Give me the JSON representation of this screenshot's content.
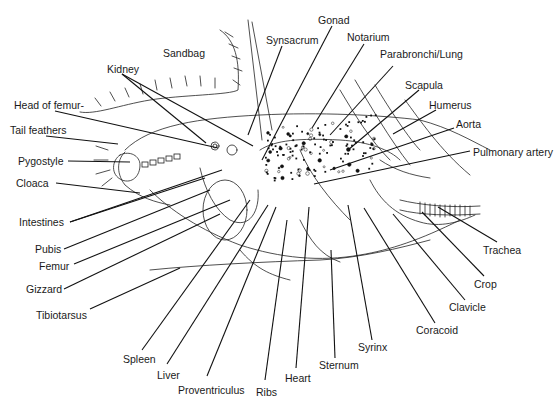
{
  "figure": {
    "type": "anatomical-diagram",
    "labels": [
      {
        "id": "gonad",
        "text": "Gonad",
        "x": 318,
        "y": 14,
        "lx1": 332,
        "ly1": 26,
        "lx2": 262,
        "ly2": 160
      },
      {
        "id": "synsacrum",
        "text": "Synsacrum",
        "x": 266,
        "y": 34,
        "lx1": 282,
        "ly1": 46,
        "lx2": 248,
        "ly2": 135
      },
      {
        "id": "notarium",
        "text": "Notarium",
        "x": 347,
        "y": 31,
        "lx1": 364,
        "ly1": 44,
        "lx2": 312,
        "ly2": 128
      },
      {
        "id": "sandbag",
        "text": "Sandbag",
        "x": 163,
        "y": 47,
        "lx1": null,
        "ly1": null,
        "lx2": null,
        "ly2": null
      },
      {
        "id": "parabronchi-lung",
        "text": "Parabronchi/Lung",
        "x": 380,
        "y": 48,
        "lx1": 393,
        "ly1": 66,
        "lx2": 330,
        "ly2": 135
      },
      {
        "id": "kidney",
        "text": "Kidney",
        "x": 107,
        "y": 63,
        "lx1": 122,
        "ly1": 74,
        "lx2": 206,
        "ly2": 143
      },
      {
        "id": "scapula",
        "text": "Scapula",
        "x": 405,
        "y": 79,
        "lx1": 419,
        "ly1": 90,
        "lx2": 348,
        "ly2": 150
      },
      {
        "id": "head-of-femur",
        "text": "Head of femur-",
        "x": 14,
        "y": 99,
        "lx1": 55,
        "ly1": 111,
        "lx2": 218,
        "ly2": 148
      },
      {
        "id": "humerus",
        "text": "Humerus",
        "x": 429,
        "y": 99,
        "lx1": 436,
        "ly1": 110,
        "lx2": 393,
        "ly2": 134
      },
      {
        "id": "aorta",
        "text": "Aorta",
        "x": 456,
        "y": 118,
        "lx1": 454,
        "ly1": 128,
        "lx2": 330,
        "ly2": 170
      },
      {
        "id": "tail-feathers",
        "text": "Tail feathers",
        "x": 10,
        "y": 124,
        "lx1": 46,
        "ly1": 136,
        "lx2": 118,
        "ly2": 144
      },
      {
        "id": "pulmonary-artery",
        "text": "Pulmonary artery",
        "x": 473,
        "y": 146,
        "lx1": 470,
        "ly1": 151,
        "lx2": 314,
        "ly2": 184
      },
      {
        "id": "pygostyle",
        "text": "Pygostyle",
        "x": 18,
        "y": 155,
        "lx1": 68,
        "ly1": 161,
        "lx2": 130,
        "ly2": 162
      },
      {
        "id": "cloaca",
        "text": "Cloaca",
        "x": 16,
        "y": 177,
        "lx1": 56,
        "ly1": 183,
        "lx2": 140,
        "ly2": 193
      },
      {
        "id": "intestines",
        "text": "Intestines",
        "x": 19,
        "y": 216,
        "lx1": 70,
        "ly1": 222,
        "lx2": 205,
        "ly2": 178
      },
      {
        "id": "pubis",
        "text": "Pubis",
        "x": 35,
        "y": 243,
        "lx1": 64,
        "ly1": 249,
        "lx2": 210,
        "ly2": 190
      },
      {
        "id": "femur",
        "text": "Femur",
        "x": 39,
        "y": 260,
        "lx1": 74,
        "ly1": 264,
        "lx2": 230,
        "ly2": 200
      },
      {
        "id": "gizzard",
        "text": "Gizzard",
        "x": 26,
        "y": 283,
        "lx1": 64,
        "ly1": 289,
        "lx2": 220,
        "ly2": 214
      },
      {
        "id": "trachea",
        "text": "Trachea",
        "x": 483,
        "y": 244,
        "lx1": 497,
        "ly1": 242,
        "lx2": 438,
        "ly2": 207
      },
      {
        "id": "crop",
        "text": "Crop",
        "x": 474,
        "y": 278,
        "lx1": 484,
        "ly1": 276,
        "lx2": 422,
        "ly2": 212
      },
      {
        "id": "tibiotarsus",
        "text": "Tibiotarsus",
        "x": 36,
        "y": 309,
        "lx1": 90,
        "ly1": 309,
        "lx2": 180,
        "ly2": 268
      },
      {
        "id": "clavicle",
        "text": "Clavicle",
        "x": 449,
        "y": 301,
        "lx1": 465,
        "ly1": 300,
        "lx2": 393,
        "ly2": 214
      },
      {
        "id": "coracoid",
        "text": "Coracoid",
        "x": 416,
        "y": 324,
        "lx1": 435,
        "ly1": 323,
        "lx2": 364,
        "ly2": 208
      },
      {
        "id": "syrinx",
        "text": "Syrinx",
        "x": 358,
        "y": 341,
        "lx1": 372,
        "ly1": 340,
        "lx2": 348,
        "ly2": 205
      },
      {
        "id": "sternum",
        "text": "Sternum",
        "x": 319,
        "y": 359,
        "lx1": 335,
        "ly1": 358,
        "lx2": 331,
        "ly2": 250
      },
      {
        "id": "spleen",
        "text": "Spleen",
        "x": 123,
        "y": 353,
        "lx1": 142,
        "ly1": 350,
        "lx2": 250,
        "ly2": 200
      },
      {
        "id": "heart",
        "text": "Heart",
        "x": 285,
        "y": 372,
        "lx1": 296,
        "ly1": 368,
        "lx2": 309,
        "ly2": 207
      },
      {
        "id": "liver",
        "text": "Liver",
        "x": 157,
        "y": 369,
        "lx1": 167,
        "ly1": 364,
        "lx2": 268,
        "ly2": 205
      },
      {
        "id": "ribs",
        "text": "Ribs",
        "x": 256,
        "y": 386,
        "lx1": 265,
        "ly1": 380,
        "lx2": 287,
        "ly2": 220
      },
      {
        "id": "proventriculus",
        "text": "Proventriculus",
        "x": 178,
        "y": 384,
        "lx1": 207,
        "ly1": 376,
        "lx2": 276,
        "ly2": 207
      }
    ],
    "extra_leaders": [
      {
        "for": "kidney",
        "lx1": 122,
        "ly1": 74,
        "lx2": 253,
        "ly2": 146
      },
      {
        "for": "intestines",
        "lx1": 70,
        "ly1": 222,
        "lx2": 222,
        "ly2": 170
      }
    ]
  }
}
